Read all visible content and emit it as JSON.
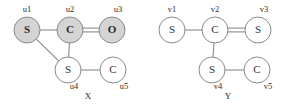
{
  "figure": {
    "width": 294,
    "height": 109,
    "background": "#ffffff",
    "colors": {
      "shaded_node_fill": "#d4d4d4",
      "plain_node_fill": "#ffffff",
      "stroke": "#8a8a8a",
      "text": "#2b2b2b"
    }
  },
  "graphs": [
    {
      "id": "X",
      "caption": "X",
      "caption_pos": {
        "x": 88,
        "y": 99
      },
      "nodes": [
        {
          "id": "u1",
          "symbol": "S",
          "label": "u1",
          "cx": 27,
          "cy": 30,
          "r": 13,
          "shaded": true,
          "label_x": 27,
          "label_y": 12
        },
        {
          "id": "u2",
          "symbol": "C",
          "label": "u2",
          "cx": 70,
          "cy": 30,
          "r": 13,
          "shaded": true,
          "label_x": 70,
          "label_y": 12
        },
        {
          "id": "u3",
          "symbol": "O",
          "label": "u3",
          "cx": 112,
          "cy": 30,
          "r": 13,
          "shaded": true,
          "label_x": 118,
          "label_y": 12
        },
        {
          "id": "u4",
          "symbol": "S",
          "label": "u4",
          "cx": 68,
          "cy": 70,
          "r": 13,
          "shaded": false,
          "label_x": 74,
          "label_y": 89
        },
        {
          "id": "u5",
          "symbol": "C",
          "label": "u5",
          "cx": 113,
          "cy": 70,
          "r": 13,
          "shaded": false,
          "label_x": 124,
          "label_y": 89
        }
      ],
      "edges": [
        {
          "from": "u1",
          "to": "u2",
          "order": 1
        },
        {
          "from": "u2",
          "to": "u3",
          "order": 2
        },
        {
          "from": "u2",
          "to": "u4",
          "order": 1
        },
        {
          "from": "u1",
          "to": "u4",
          "order": 1
        },
        {
          "from": "u4",
          "to": "u5",
          "order": 1
        }
      ]
    },
    {
      "id": "Y",
      "caption": "Y",
      "caption_pos": {
        "x": 228,
        "y": 99
      },
      "nodes": [
        {
          "id": "v1",
          "symbol": "S",
          "label": "v1",
          "cx": 172,
          "cy": 30,
          "r": 13,
          "shaded": false,
          "label_x": 172,
          "label_y": 12
        },
        {
          "id": "v2",
          "symbol": "C",
          "label": "v2",
          "cx": 215,
          "cy": 30,
          "r": 13,
          "shaded": false,
          "label_x": 215,
          "label_y": 12
        },
        {
          "id": "v3",
          "symbol": "S",
          "label": "v3",
          "cx": 258,
          "cy": 30,
          "r": 13,
          "shaded": false,
          "label_x": 264,
          "label_y": 12
        },
        {
          "id": "v4",
          "symbol": "S",
          "label": "v4",
          "cx": 212,
          "cy": 70,
          "r": 13,
          "shaded": false,
          "label_x": 218,
          "label_y": 89
        },
        {
          "id": "v5",
          "symbol": "C",
          "label": "v5",
          "cx": 257,
          "cy": 70,
          "r": 13,
          "shaded": false,
          "label_x": 268,
          "label_y": 89
        }
      ],
      "edges": [
        {
          "from": "v1",
          "to": "v2",
          "order": 1
        },
        {
          "from": "v2",
          "to": "v3",
          "order": 2
        },
        {
          "from": "v2",
          "to": "v4",
          "order": 1
        },
        {
          "from": "v4",
          "to": "v5",
          "order": 1
        }
      ]
    }
  ]
}
